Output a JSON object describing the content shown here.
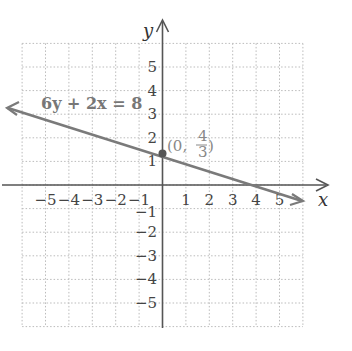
{
  "graph": {
    "x_axis_label": "x",
    "y_axis_label": "y",
    "x_ticks": [
      "−5",
      "−4",
      "−3",
      "−2",
      "−1",
      "1",
      "2",
      "3",
      "4",
      "5"
    ],
    "y_ticks": [
      "5",
      "4",
      "3",
      "2",
      "1",
      "−1",
      "−2",
      "−3",
      "−4",
      "−5"
    ],
    "grid_range": {
      "x": [
        -6,
        6
      ],
      "y": [
        -6,
        6
      ]
    },
    "equation_label": "6y + 2x = 8",
    "point_label_prefix": "(0, ",
    "point_label_num": "4",
    "point_label_den": "3",
    "point_label_suffix": ")",
    "colors": {
      "line": "#7a7a7a",
      "axes": "#555555",
      "grid": "#bbbbbb",
      "point": "#555555"
    }
  },
  "chart_data": {
    "type": "line",
    "title": "",
    "xlabel": "x",
    "ylabel": "y",
    "xlim": [
      -6,
      6
    ],
    "ylim": [
      -6,
      6
    ],
    "grid": true,
    "series": [
      {
        "name": "6y + 2x = 8",
        "x": [
          -6.5,
          6.2
        ],
        "y": [
          3.5,
          -0.73
        ]
      }
    ],
    "annotations": [
      {
        "text": "6y + 2x = 8",
        "x": -5.5,
        "y": 3.5
      },
      {
        "text": "(0, 4/3)",
        "x": 0,
        "y": 1.333,
        "marker": "point"
      }
    ]
  }
}
